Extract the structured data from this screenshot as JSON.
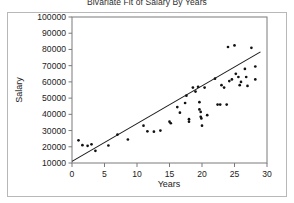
{
  "chart_data": {
    "type": "scatter",
    "title": "Bivariate Fit of Salary By Years",
    "xlabel": "Years",
    "ylabel": "Salary",
    "xlim": [
      0,
      30
    ],
    "ylim": [
      10000,
      100000
    ],
    "xticks": [
      0,
      5,
      10,
      15,
      20,
      25,
      30
    ],
    "yticks": [
      10000,
      20000,
      30000,
      40000,
      50000,
      60000,
      70000,
      80000,
      90000,
      100000
    ],
    "xtick_labels": [
      "0",
      "5",
      "10",
      "15",
      "20",
      "25",
      "30"
    ],
    "ytick_labels": [
      "10000",
      "20000",
      "30000",
      "40000",
      "50000",
      "60000",
      "70000",
      "80000",
      "90000",
      "100000"
    ],
    "grid": false,
    "legend": "none",
    "marker_color": "#111111",
    "line_color": "#1a1a1a",
    "frame_color": "#7a7a7a",
    "series": [
      {
        "name": "Salary vs Years",
        "points": [
          [
            1.0,
            24000
          ],
          [
            1.6,
            21000
          ],
          [
            2.4,
            20600
          ],
          [
            3.0,
            21500
          ],
          [
            3.6,
            17500
          ],
          [
            5.6,
            20800
          ],
          [
            7.0,
            27500
          ],
          [
            8.6,
            24500
          ],
          [
            11.0,
            33000
          ],
          [
            11.6,
            29500
          ],
          [
            12.6,
            29300
          ],
          [
            13.6,
            30000
          ],
          [
            15.0,
            35500
          ],
          [
            15.2,
            34500
          ],
          [
            16.2,
            44500
          ],
          [
            16.6,
            41000
          ],
          [
            17.4,
            47000
          ],
          [
            17.6,
            51500
          ],
          [
            18.0,
            37000
          ],
          [
            18.0,
            35500
          ],
          [
            18.6,
            56500
          ],
          [
            19.0,
            54000
          ],
          [
            19.4,
            57000
          ],
          [
            19.6,
            47500
          ],
          [
            19.6,
            43000
          ],
          [
            19.8,
            41500
          ],
          [
            19.8,
            38500
          ],
          [
            19.9,
            37500
          ],
          [
            20.0,
            33000
          ],
          [
            20.4,
            56500
          ],
          [
            20.8,
            39500
          ],
          [
            22.0,
            62000
          ],
          [
            22.4,
            46000
          ],
          [
            22.8,
            46000
          ],
          [
            23.0,
            58000
          ],
          [
            23.4,
            56500
          ],
          [
            23.8,
            46000
          ],
          [
            24.0,
            81500
          ],
          [
            24.2,
            60500
          ],
          [
            24.6,
            61500
          ],
          [
            25.0,
            82500
          ],
          [
            25.2,
            65000
          ],
          [
            25.6,
            63000
          ],
          [
            25.8,
            58000
          ],
          [
            26.0,
            60000
          ],
          [
            26.6,
            68000
          ],
          [
            26.8,
            63000
          ],
          [
            27.0,
            57500
          ],
          [
            27.6,
            81000
          ],
          [
            28.2,
            69500
          ],
          [
            28.2,
            61500
          ]
        ]
      }
    ],
    "fit_line": {
      "name": "linear-fit",
      "x_start": 0,
      "y_start": 11000,
      "x_end": 29.0,
      "y_end": 78500
    }
  }
}
